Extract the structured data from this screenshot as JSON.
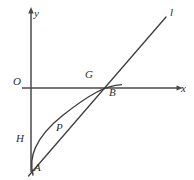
{
  "figure": {
    "width": 194,
    "height": 180,
    "background_color": "#ffffff",
    "stroke_color": "#3d3d3d",
    "axis_color": "#4a4a4a",
    "label_color": "#2e2e2e"
  },
  "axes": {
    "y_axis": {
      "label": "y",
      "label_x": 34,
      "label_y": 8,
      "origin_label": "O",
      "origin_label_x": 13,
      "origin_label_y": 76
    },
    "x_axis": {
      "label": "x",
      "label_x": 181,
      "label_y": 83
    }
  },
  "line": {
    "label": "l",
    "label_x": 170,
    "label_y": 7
  },
  "points": [
    {
      "id": "G",
      "label": "G",
      "label_x": 85,
      "label_y": 69,
      "x": 92,
      "y": 88
    },
    {
      "id": "B",
      "label": "B",
      "label_x": 109,
      "label_y": 87,
      "x": 117,
      "y": 85
    },
    {
      "id": "P",
      "label": "P",
      "label_x": 56,
      "label_y": 122,
      "x": 62,
      "y": 116
    },
    {
      "id": "H",
      "label": "H",
      "label_x": 16,
      "label_y": 133,
      "x": 31,
      "y": 143
    },
    {
      "id": "A",
      "label": "A",
      "label_x": 34,
      "label_y": 162,
      "x": 33,
      "y": 174
    }
  ]
}
